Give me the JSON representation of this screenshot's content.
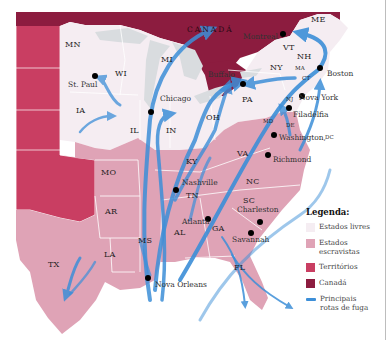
{
  "colors": {
    "free_states": "#f5edf2",
    "slave_states": "#dfa3b6",
    "territories": "#c93e62",
    "canada": "#8c1c3f",
    "routes": "#3d8fd8",
    "lakes": "#d9dcdf",
    "border": "#ffffff"
  },
  "map": {
    "country_label": "CANADÁ",
    "states": [
      {
        "code": "MN",
        "x": 72,
        "y": 45
      },
      {
        "code": "WI",
        "x": 122,
        "y": 74
      },
      {
        "code": "MI",
        "x": 168,
        "y": 60
      },
      {
        "code": "IA",
        "x": 83,
        "y": 111
      },
      {
        "code": "IL",
        "x": 137,
        "y": 131
      },
      {
        "code": "IN",
        "x": 173,
        "y": 131
      },
      {
        "code": "OH",
        "x": 213,
        "y": 118
      },
      {
        "code": "NY",
        "x": 277,
        "y": 68
      },
      {
        "code": "PA",
        "x": 249,
        "y": 100
      },
      {
        "code": "VT",
        "x": 290,
        "y": 48
      },
      {
        "code": "NH",
        "x": 304,
        "y": 57
      },
      {
        "code": "ME",
        "x": 318,
        "y": 20
      },
      {
        "code": "MA",
        "x": 300,
        "y": 70,
        "small": true
      },
      {
        "code": "CT",
        "x": 307,
        "y": 80,
        "small": true
      },
      {
        "code": "NJ",
        "x": 291,
        "y": 101,
        "small": true
      },
      {
        "code": "MD",
        "x": 268,
        "y": 123,
        "small": true
      },
      {
        "code": "DE",
        "x": 291,
        "y": 127,
        "small": true
      },
      {
        "code": "VA",
        "x": 244,
        "y": 154
      },
      {
        "code": "KY",
        "x": 193,
        "y": 162
      },
      {
        "code": "TN",
        "x": 193,
        "y": 196
      },
      {
        "code": "NC",
        "x": 253,
        "y": 182
      },
      {
        "code": "SC",
        "x": 250,
        "y": 201
      },
      {
        "code": "GA",
        "x": 219,
        "y": 229
      },
      {
        "code": "AL",
        "x": 181,
        "y": 233
      },
      {
        "code": "MS",
        "x": 145,
        "y": 241
      },
      {
        "code": "LA",
        "x": 111,
        "y": 255
      },
      {
        "code": "AR",
        "x": 112,
        "y": 212
      },
      {
        "code": "MO",
        "x": 108,
        "y": 173
      },
      {
        "code": "TX",
        "x": 55,
        "y": 265
      },
      {
        "code": "FL",
        "x": 241,
        "y": 268
      }
    ],
    "cities": [
      {
        "name": "Montreal",
        "x": 243,
        "y": 37,
        "dot_x": 283,
        "dot_y": 34,
        "label_side": "left"
      },
      {
        "name": "Boston",
        "x": 327,
        "y": 74,
        "dot_x": 320,
        "dot_y": 68
      },
      {
        "name": "Buffalo",
        "x": 208,
        "y": 75,
        "dot_x": 243,
        "dot_y": 84,
        "label_side": "left"
      },
      {
        "name": "Nova York",
        "x": 299,
        "y": 98,
        "dot_x": 302,
        "dot_y": 96
      },
      {
        "name": "Filadélfia",
        "x": 293,
        "y": 115,
        "dot_x": 289,
        "dot_y": 108
      },
      {
        "name": "Washington,",
        "x": 279,
        "y": 138,
        "dot_x": 274,
        "dot_y": 135
      },
      {
        "name": "DC",
        "x": 325,
        "y": 139,
        "small": true
      },
      {
        "name": "Richmond",
        "x": 273,
        "y": 160,
        "dot_x": 268,
        "dot_y": 155
      },
      {
        "name": "St. Paul",
        "x": 68,
        "y": 85,
        "dot_x": 95,
        "dot_y": 76,
        "label_side": "left"
      },
      {
        "name": "Chicago",
        "x": 160,
        "y": 99,
        "dot_x": 151,
        "dot_y": 112
      },
      {
        "name": "Nashville",
        "x": 182,
        "y": 183,
        "dot_x": 176,
        "dot_y": 190
      },
      {
        "name": "Charleston",
        "x": 237,
        "y": 210,
        "dot_x": 260,
        "dot_y": 222
      },
      {
        "name": "Atlanta",
        "x": 182,
        "y": 222,
        "dot_x": 208,
        "dot_y": 219
      },
      {
        "name": "Savannah",
        "x": 232,
        "y": 240,
        "dot_x": 251,
        "dot_y": 233
      },
      {
        "name": "Nova Orleans",
        "x": 155,
        "y": 285,
        "dot_x": 148,
        "dot_y": 278
      }
    ]
  },
  "legend": {
    "title": "Legenda:",
    "items": [
      {
        "label": "Estados livres",
        "type": "swatch",
        "color": "#f5edf2"
      },
      {
        "label": "Estados escravistas",
        "type": "swatch",
        "color": "#dfa3b6"
      },
      {
        "label": "Territórios",
        "type": "swatch",
        "color": "#c93e62"
      },
      {
        "label": "Canadá",
        "type": "swatch",
        "color": "#8c1c3f"
      },
      {
        "label": "Principais rotas de fuga",
        "type": "line",
        "color": "#3d8fd8"
      }
    ]
  }
}
